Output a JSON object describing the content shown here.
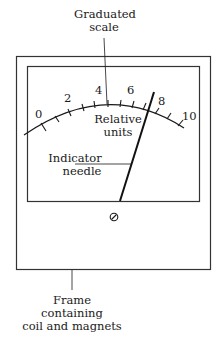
{
  "labels": {
    "scale_label_line1": "Graduated",
    "scale_label_line2": "scale",
    "units_line1": "Relative",
    "units_line2": "units",
    "needle_line1": "Indicator",
    "needle_line2": "needle",
    "frame_line1": "Frame",
    "frame_line2": "containing",
    "frame_line3": "coil and magnets"
  },
  "scale": {
    "ticks": [
      "0",
      "2",
      "4",
      "6",
      "8",
      "10"
    ],
    "min": 0,
    "max": 10,
    "needle_value": 7.5
  },
  "icons": {
    "zero_adjust_screw": "screw-slot-icon"
  },
  "colors": {
    "line": "#1a1a1a",
    "frame": "#333333",
    "background": "#ffffff"
  }
}
